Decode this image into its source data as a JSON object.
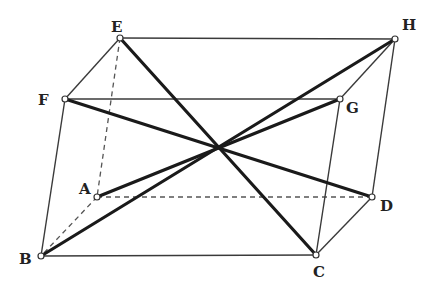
{
  "diagram": {
    "type": "parallelepiped",
    "vertices": {
      "A": {
        "x": 97,
        "y": 197,
        "label": "A",
        "label_dx": -18,
        "label_dy": -3
      },
      "B": {
        "x": 41,
        "y": 256,
        "label": "B",
        "label_dx": -22,
        "label_dy": 8
      },
      "C": {
        "x": 316,
        "y": 255,
        "label": "C",
        "label_dx": -3,
        "label_dy": 22
      },
      "D": {
        "x": 372,
        "y": 197,
        "label": "D",
        "label_dx": 8,
        "label_dy": 14
      },
      "E": {
        "x": 120,
        "y": 38,
        "label": "E",
        "label_dx": -9,
        "label_dy": -6
      },
      "F": {
        "x": 65,
        "y": 99,
        "label": "F",
        "label_dx": -27,
        "label_dy": 6
      },
      "G": {
        "x": 340,
        "y": 99,
        "label": "G",
        "label_dx": 6,
        "label_dy": 14
      },
      "H": {
        "x": 395,
        "y": 39,
        "label": "H",
        "label_dx": 7,
        "label_dy": -9
      }
    },
    "edges_visible": [
      [
        "E",
        "H"
      ],
      [
        "H",
        "G"
      ],
      [
        "G",
        "F"
      ],
      [
        "F",
        "E"
      ],
      [
        "D",
        "C"
      ],
      [
        "C",
        "B"
      ],
      [
        "F",
        "B"
      ],
      [
        "G",
        "C"
      ],
      [
        "H",
        "D"
      ]
    ],
    "edges_hidden": [
      [
        "A",
        "D"
      ],
      [
        "A",
        "B"
      ],
      [
        "E",
        "A"
      ]
    ],
    "diagonals": [
      [
        "E",
        "C"
      ],
      [
        "H",
        "B"
      ],
      [
        "F",
        "D"
      ],
      [
        "G",
        "A"
      ]
    ],
    "center": {
      "x": 218,
      "y": 147
    }
  }
}
